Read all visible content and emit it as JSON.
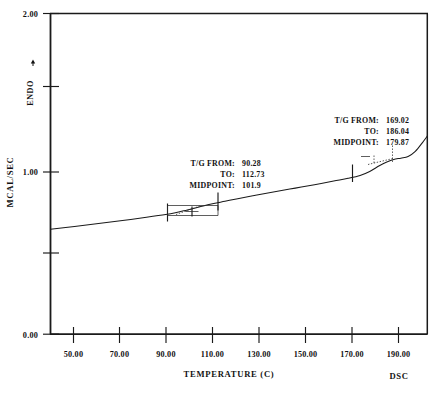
{
  "chart_data": {
    "type": "line",
    "title": "",
    "subtitle": "",
    "xlabel": "TEMPERATURE (C)",
    "ylabel": "MCAL/SEC",
    "y_direction_label": "ENDO",
    "corner_label": "DSC",
    "grid": false,
    "legend": null,
    "xlim": [
      40,
      197
    ],
    "ylim": [
      0.0,
      2.0
    ],
    "x_ticks": [
      "50.00",
      "70.00",
      "90.00",
      "110.00",
      "130.00",
      "150.00",
      "170.00",
      "190.00"
    ],
    "x_tick_values": [
      50,
      70,
      90,
      110,
      130,
      150,
      170,
      190
    ],
    "y_ticks": [
      "2.00",
      "1.00",
      "0.00"
    ],
    "y_tick_values": [
      2.0,
      1.0,
      0.0
    ],
    "y_minor_tick_values": [
      1.5,
      0.5
    ],
    "series": [
      {
        "name": "DSC heat flow",
        "x": [
          40,
          50,
          60,
          70,
          80,
          88,
          92,
          97,
          101.9,
          107,
          112.7,
          118,
          126,
          134,
          142,
          150,
          158,
          164,
          169,
          173,
          177,
          179.9,
          183,
          186,
          189,
          192,
          195,
          197
        ],
        "y": [
          0.655,
          0.672,
          0.69,
          0.709,
          0.729,
          0.746,
          0.757,
          0.775,
          0.793,
          0.812,
          0.829,
          0.845,
          0.868,
          0.89,
          0.911,
          0.932,
          0.955,
          0.972,
          0.99,
          1.015,
          1.05,
          1.072,
          1.09,
          1.098,
          1.108,
          1.14,
          1.195,
          1.235
        ]
      }
    ],
    "annotations": [
      {
        "id": "transition-1",
        "lines": [
          {
            "label": "T/G FROM:",
            "value": "90.28"
          },
          {
            "label": "TO:",
            "value": "112.73"
          },
          {
            "label": "MIDPOINT:",
            "value": "101.9"
          }
        ],
        "onset": 90.28,
        "endset": 112.73,
        "midpoint": 101.9
      },
      {
        "id": "transition-2",
        "lines": [
          {
            "label": "T/G FROM:",
            "value": "169.02"
          },
          {
            "label": "TO:",
            "value": "186.04"
          },
          {
            "label": "MIDPOINT:",
            "value": "179.87"
          }
        ],
        "onset": 169.02,
        "endset": 186.04,
        "midpoint": 179.87
      }
    ],
    "colors": {
      "curve": "#1a1a1a",
      "axis": "#1a1a1a",
      "background": "#ffffff"
    }
  }
}
